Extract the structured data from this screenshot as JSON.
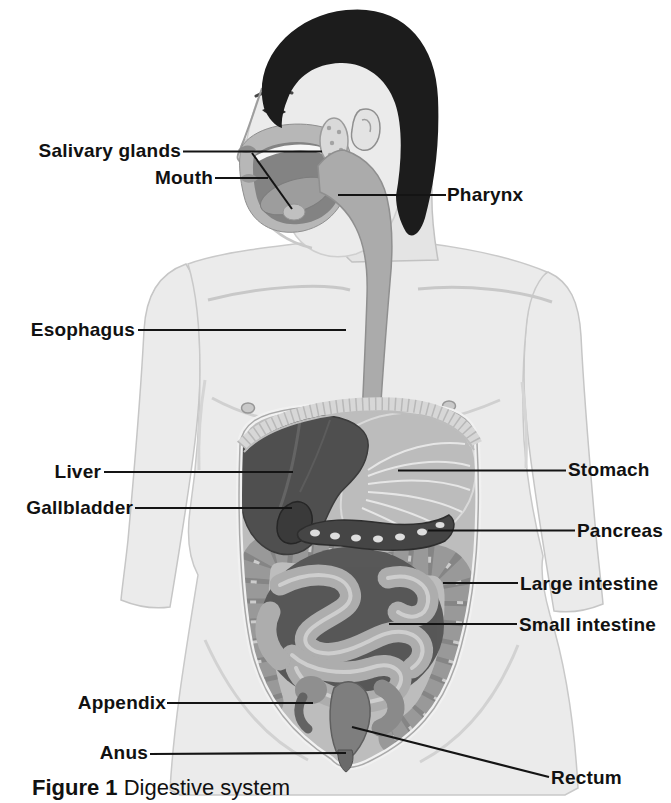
{
  "caption": {
    "prefix": "Figure 1",
    "title": "Digestive system"
  },
  "labels": {
    "salivary_glands": "Salivary glands",
    "mouth": "Mouth",
    "pharynx": "Pharynx",
    "esophagus": "Esophagus",
    "liver": "Liver",
    "stomach": "Stomach",
    "gallbladder": "Gallbladder",
    "pancreas": "Pancreas",
    "large_intestine": "Large intestine",
    "small_intestine": "Small intestine",
    "appendix": "Appendix",
    "anus": "Anus",
    "rectum": "Rectum"
  },
  "colors": {
    "ink": "#141414",
    "label_text": "#111111",
    "skin": "#ebebeb",
    "hair": "#1c1c1c",
    "liver": "#4f4f4f",
    "stomach": "#bcbcbc",
    "intestine": "#a8a8a8",
    "cavity": "#bdbdbd"
  }
}
